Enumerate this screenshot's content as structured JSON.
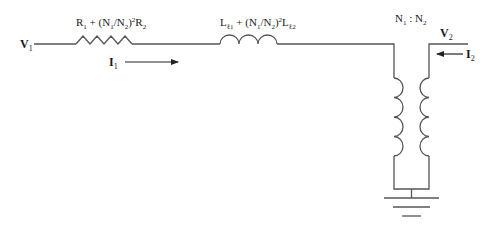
{
  "diagram": {
    "type": "transformer-equivalent-circuit",
    "colors": {
      "wire": "#555555",
      "text": "#1a1a1a",
      "background": "#ffffff"
    },
    "labels": {
      "v1": {
        "main": "V",
        "sub": "1"
      },
      "v2": {
        "main": "V",
        "sub": "2"
      },
      "i1": {
        "main": "I",
        "sub": "1"
      },
      "i2": {
        "main": "I",
        "sub": "2"
      },
      "resistance": {
        "p1": "R",
        "s1": "1",
        "p2": " + (N",
        "s2": "1",
        "p3": "/N",
        "s3": "2",
        "p4": ")",
        "sup": "2",
        "p5": "R",
        "s5": "2"
      },
      "inductance": {
        "p1": "L",
        "s1": "ℓ1",
        "p2": " + (N",
        "s2": "1",
        "p3": "/N",
        "s3": "2",
        "p4": ")",
        "sup": "2",
        "p5": "L",
        "s5": "ℓ2"
      },
      "ratio": {
        "p1": "N",
        "s1": "1",
        "p2": " : N",
        "s2": "2"
      }
    },
    "components": [
      {
        "id": "series-resistor",
        "kind": "resistor"
      },
      {
        "id": "series-inductor",
        "kind": "inductor"
      },
      {
        "id": "ideal-transformer",
        "kind": "transformer",
        "turns": 4
      },
      {
        "id": "ground",
        "kind": "ground"
      }
    ]
  }
}
